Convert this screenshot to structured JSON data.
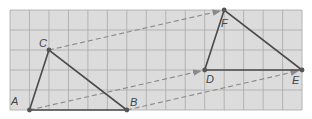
{
  "diagram": {
    "grid": {
      "cols": 15,
      "rows": 5,
      "origin_x": 10,
      "origin_y": 10,
      "cell_w": 19.47,
      "cell_h": 20,
      "bg": "#dcdcdc",
      "line": "#a8a8a8"
    },
    "triangle_original": {
      "points": [
        {
          "label": "A",
          "gx": 1,
          "gy": 5
        },
        {
          "label": "B",
          "gx": 6,
          "gy": 5
        },
        {
          "label": "C",
          "gx": 2,
          "gy": 2
        }
      ]
    },
    "triangle_image": {
      "points": [
        {
          "label": "D",
          "gx": 10,
          "gy": 3
        },
        {
          "label": "E",
          "gx": 15,
          "gy": 3
        },
        {
          "label": "F",
          "gx": 11,
          "gy": 0
        }
      ]
    },
    "translation_vector": {
      "dx": 9,
      "dy": -2
    },
    "labels": {
      "A": "A",
      "B": "B",
      "C": "C",
      "D": "D",
      "E": "E",
      "F": "F"
    },
    "colors": {
      "triangle": "#4a4a4a",
      "arrow": "#8a8a8a",
      "point": "#555555"
    }
  }
}
